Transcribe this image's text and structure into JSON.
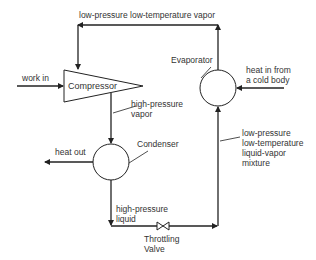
{
  "diagram": {
    "labels": {
      "top_flow": "low-pressure low-temperature vapor",
      "work_in": "work in",
      "compressor": "Compressor",
      "hp_vapor_1": "high-pressure",
      "hp_vapor_2": "vapor",
      "evaporator": "Evaporator",
      "heat_in_1": "heat in from",
      "heat_in_2": "a  cold body",
      "heat_out": "heat out",
      "condenser": "Condenser",
      "mixture_1": "low-pressure",
      "mixture_2": "low-temperature",
      "mixture_3": "liquid-vapor",
      "mixture_4": "mixture",
      "hp_liquid_1": "high-pressure",
      "hp_liquid_2": "liquid",
      "valve_1": "Throttling",
      "valve_2": "Valve"
    },
    "components": [
      "Compressor",
      "Condenser",
      "Throttling Valve",
      "Evaporator"
    ],
    "colors": {
      "line": "#222222",
      "text": "#333333",
      "background": "#ffffff"
    }
  }
}
